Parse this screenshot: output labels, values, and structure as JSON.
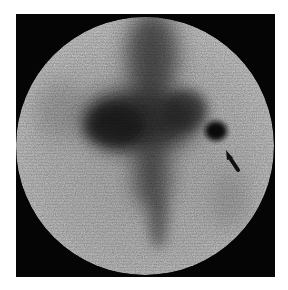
{
  "image": {
    "kind": "scintigraphy scan",
    "description": "Circular gamma-camera view with dark uptake regions and an arrow pointing to a focal dark spot",
    "colors": {
      "background": "#ffffff",
      "frame": "#050505",
      "field_light": "#c9c9c9",
      "uptake_dark": "#1a1a1a"
    },
    "annotations": [
      {
        "type": "arrow",
        "target": "focal-uptake-spot",
        "direction": "pointing up-left"
      }
    ]
  }
}
